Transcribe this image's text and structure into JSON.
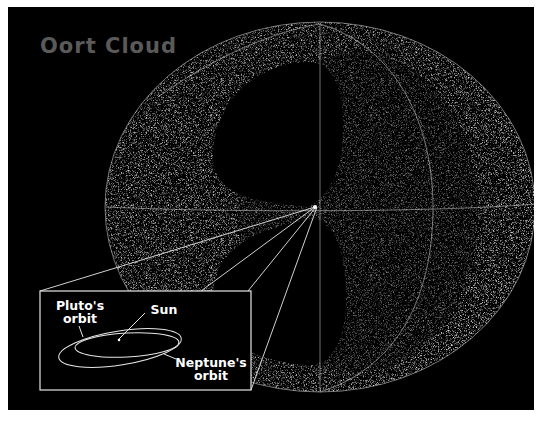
{
  "title": "Oort Cloud",
  "inset": {
    "labels": {
      "pluto": "Pluto's orbit",
      "pluto_line1": "Pluto's",
      "pluto_line2": "orbit",
      "sun": "Sun",
      "neptune_line1": "Neptune's",
      "neptune_line2": "orbit"
    }
  },
  "colors": {
    "background": "#000000",
    "title": "#5a5a5a",
    "lines": "#ffffff",
    "cloud": "#bfbfbf"
  }
}
